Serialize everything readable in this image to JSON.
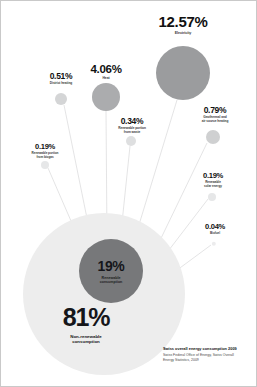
{
  "chart_data": {
    "type": "bubble",
    "title": "Swiss overall energy consumption 2009",
    "source": "Swiss Federal Office of Energy, Swiss Overall\nEnergy Statistics, 2009",
    "unit": "percent of overall energy consumption",
    "core": [
      {
        "id": "non-renewable",
        "value": 81,
        "value_label": "81%",
        "name": "Non-renewable\nconsumption",
        "cx": 103,
        "cy": 293,
        "r": 81,
        "color": "#ededed"
      },
      {
        "id": "renewable",
        "value": 19,
        "value_label": "19%",
        "name": "Renewable\nconsumption",
        "cx": 110,
        "cy": 270,
        "r": 32,
        "color": "#77787a"
      }
    ],
    "categories": [
      "Electricity",
      "Heat",
      "Geothermal and\nair source heating",
      "District heating",
      "Renewable portion\nfrom waste",
      "Renewable portion\nfrom biogas",
      "Renewable\nsolar energy",
      "Biofuel"
    ],
    "values": [
      12.57,
      4.06,
      0.79,
      0.51,
      0.34,
      0.19,
      0.19,
      0.04
    ],
    "bubbles": [
      {
        "id": "electricity",
        "value": 12.57,
        "value_label": "12.57%",
        "name": "Electricity",
        "cx": 182,
        "cy": 72,
        "r": 27,
        "color": "#9b9c9e",
        "label_x": 182,
        "label_y": 13,
        "tier": "tier-xl",
        "line": {
          "x1": 176,
          "y1": 99,
          "x2": 130,
          "y2": 250
        }
      },
      {
        "id": "heat",
        "value": 4.06,
        "value_label": "4.06%",
        "name": "Heat",
        "cx": 105,
        "cy": 96,
        "r": 14,
        "color": "#abacae",
        "label_x": 105,
        "label_y": 62,
        "tier": "tier-lg",
        "line": {
          "x1": 105,
          "y1": 110,
          "x2": 106,
          "y2": 240
        }
      },
      {
        "id": "geothermal",
        "value": 0.79,
        "value_label": "0.79%",
        "name": "Geothermal and\nair source heating",
        "cx": 212,
        "cy": 136,
        "r": 7,
        "color": "#cfd0d1",
        "label_x": 214,
        "label_y": 105,
        "tier": "tier-md",
        "line": {
          "x1": 206,
          "y1": 142,
          "x2": 150,
          "y2": 258
        }
      },
      {
        "id": "district-heating",
        "value": 0.51,
        "value_label": "0.51%",
        "name": "District heating",
        "cx": 60,
        "cy": 98,
        "r": 6,
        "color": "#d4d5d6",
        "label_x": 60,
        "label_y": 71,
        "tier": "tier-md",
        "line": {
          "x1": 63,
          "y1": 104,
          "x2": 90,
          "y2": 237
        }
      },
      {
        "id": "waste",
        "value": 0.34,
        "value_label": "0.34%",
        "name": "Renewable portion\nfrom waste",
        "cx": 130,
        "cy": 140,
        "r": 5,
        "color": "#dedfe0",
        "label_x": 131,
        "label_y": 116,
        "tier": "tier-md",
        "line": {
          "x1": 129,
          "y1": 145,
          "x2": 119,
          "y2": 241
        }
      },
      {
        "id": "biogas",
        "value": 0.19,
        "value_label": "0.19%",
        "name": "Renewable portion\nfrom biogas",
        "cx": 44,
        "cy": 164,
        "r": 4,
        "color": "#e6e7e8",
        "label_x": 44,
        "label_y": 142,
        "tier": "tier-sm",
        "line": {
          "x1": 47,
          "y1": 167,
          "x2": 80,
          "y2": 243
        }
      },
      {
        "id": "solar",
        "value": 0.19,
        "value_label": "0.19%",
        "name": "Renewable\nsolar energy",
        "cx": 211,
        "cy": 196,
        "r": 4,
        "color": "#e6e7e8",
        "label_x": 212,
        "label_y": 171,
        "tier": "tier-sm",
        "line": {
          "x1": 207,
          "y1": 198,
          "x2": 158,
          "y2": 262
        }
      },
      {
        "id": "biofuel",
        "value": 0.04,
        "value_label": "0.04%",
        "name": "Biofuel",
        "cx": 213,
        "cy": 243,
        "r": 2.2,
        "color": "#ececed",
        "label_x": 214,
        "label_y": 222,
        "tier": "tier-sm",
        "line": {
          "x1": 210,
          "y1": 244,
          "x2": 168,
          "y2": 275
        }
      }
    ]
  }
}
